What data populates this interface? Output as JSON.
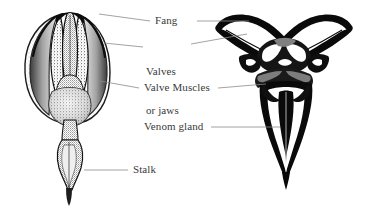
{
  "figure": {
    "background_color": "#ffffff",
    "ink_color": "#111111",
    "label_color": "#3a3a3a",
    "leader_color": "#8a8a8a",
    "width": 368,
    "height": 208
  },
  "labels": {
    "fang": "Fang",
    "valves_line1": "Valves",
    "valves_line2": "or jaws",
    "valve_muscles": "Valve Muscles",
    "venom_gland": "Venom gland",
    "stalk": "Stalk"
  },
  "views": {
    "left": {
      "name": "external-side-view",
      "style": "stippled engraving",
      "parts": [
        "fang tips",
        "valves or jaws",
        "valve muscles",
        "stalk"
      ]
    },
    "right": {
      "name": "cross-section-view",
      "style": "solid black ink",
      "parts": [
        "fang",
        "valves or jaws",
        "valve muscles",
        "venom gland"
      ]
    }
  },
  "leaders": [
    {
      "label": "fang",
      "from_left": [
        99,
        14
      ],
      "to_left": [
        150,
        22
      ],
      "from_right": [
        196,
        22
      ],
      "to_right": [
        249,
        22
      ]
    },
    {
      "label": "valves",
      "from_left": [
        103,
        42
      ],
      "to_left": [
        143,
        48
      ],
      "from_right": [
        190,
        44
      ],
      "to_right": [
        246,
        33
      ]
    },
    {
      "label": "valve_muscles",
      "from_left": [
        100,
        80
      ],
      "to_left": [
        139,
        88
      ],
      "from_right": [
        217,
        88
      ],
      "to_right": [
        266,
        84
      ]
    },
    {
      "label": "venom_gland",
      "from_left": null,
      "to_left": null,
      "from_right": [
        210,
        127
      ],
      "to_right": [
        279,
        127
      ]
    },
    {
      "label": "stalk",
      "from_left": [
        84,
        170
      ],
      "to_left": [
        128,
        170
      ],
      "from_right": null,
      "to_right": null
    }
  ]
}
